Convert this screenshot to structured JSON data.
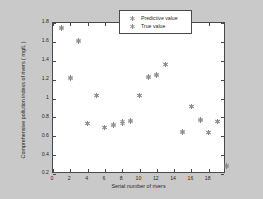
{
  "chart_data": {
    "type": "scatter",
    "title": "",
    "xlabel": "Serial number of rivers",
    "ylabel": "Comprehensive pollution indexs of rivers ( mg/L )",
    "xlim": [
      0,
      20
    ],
    "ylim": [
      0.2,
      1.8
    ],
    "grid": false,
    "legend_position": "top-right",
    "xticks": [
      0,
      2,
      4,
      6,
      8,
      10,
      12,
      14,
      16,
      18
    ],
    "xtick_labels": [
      "0",
      "2",
      "4",
      "6",
      "8",
      "10",
      "12",
      "14",
      "16",
      "18"
    ],
    "yticks": [
      0.2,
      0.4,
      0.6,
      0.8,
      1.0,
      1.2,
      1.4,
      1.6,
      1.8
    ],
    "ytick_labels": [
      "0.2",
      "0.4",
      "0.6",
      "0.8",
      "1",
      "1.2",
      "1.4",
      "1.6",
      "1.8"
    ],
    "marker": "asterisk",
    "marker_color": "#8a8a8a",
    "series": [
      {
        "name": "Predictive value",
        "marker": "asterisk",
        "color": "#8a8a8a",
        "x": [
          1,
          2,
          3,
          4,
          5,
          6,
          7,
          8,
          9,
          10,
          11,
          12,
          13,
          15,
          16,
          17,
          18,
          19,
          20
        ],
        "y": [
          1.74,
          1.21,
          1.6,
          0.73,
          1.03,
          0.69,
          0.71,
          0.74,
          0.76,
          1.03,
          1.22,
          1.24,
          1.36,
          0.64,
          0.91,
          0.77,
          0.64,
          0.76,
          0.28
        ]
      },
      {
        "name": "True value",
        "marker": "asterisk",
        "color": "#8a8a8a",
        "x": [
          1,
          2,
          3,
          4,
          5,
          6,
          7,
          8,
          9,
          10,
          11,
          12,
          13,
          15,
          16,
          17,
          18,
          19,
          20
        ],
        "y": [
          1.75,
          1.22,
          1.61,
          0.74,
          1.03,
          0.69,
          0.72,
          0.76,
          0.77,
          1.03,
          1.23,
          1.25,
          1.36,
          0.65,
          0.91,
          0.78,
          0.64,
          0.76,
          0.29
        ]
      }
    ]
  },
  "legend": {
    "entries": [
      {
        "label": "Predictive value",
        "marker_name": "asterisk-marker-predictive"
      },
      {
        "label": "True value",
        "marker_name": "asterisk-marker-true"
      }
    ]
  }
}
